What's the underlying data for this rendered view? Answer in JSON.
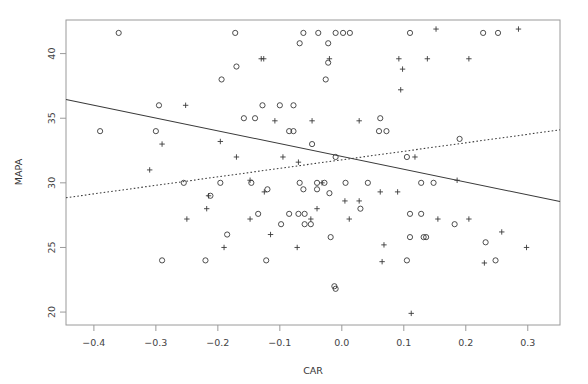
{
  "chart_data": {
    "type": "scatter",
    "title": "",
    "xlabel": "CAR",
    "ylabel": "MAPA",
    "xlim": [
      -0.445,
      0.352
    ],
    "ylim": [
      19.0,
      42.6
    ],
    "grid": false,
    "legend": "none",
    "xticks": [
      -0.4,
      -0.3,
      -0.2,
      -0.1,
      0.0,
      0.1,
      0.2,
      0.3
    ],
    "xtick_labels": [
      "-0.4",
      "-0.3",
      "-0.2",
      "-0.1",
      "0.0",
      "0.1",
      "0.2",
      "0.3"
    ],
    "yticks": [
      20,
      25,
      30,
      35,
      40
    ],
    "ytick_labels": [
      "20",
      "25",
      "30",
      "35",
      "40"
    ],
    "series": [
      {
        "name": "group-circle",
        "marker": "circle",
        "color": "#3a3a3a",
        "points": [
          [
            -0.36,
            41.6
          ],
          [
            -0.172,
            41.6
          ],
          [
            -0.062,
            41.6
          ],
          [
            -0.038,
            41.6
          ],
          [
            -0.01,
            41.6
          ],
          [
            0.002,
            41.6
          ],
          [
            0.013,
            41.6
          ],
          [
            0.11,
            41.6
          ],
          [
            0.228,
            41.6
          ],
          [
            0.252,
            41.6
          ],
          [
            -0.068,
            40.8
          ],
          [
            -0.022,
            40.8
          ],
          [
            -0.17,
            39.0
          ],
          [
            -0.022,
            39.3
          ],
          [
            -0.194,
            38.0
          ],
          [
            -0.026,
            38.0
          ],
          [
            -0.295,
            36.0
          ],
          [
            -0.128,
            36.0
          ],
          [
            -0.1,
            36.0
          ],
          [
            -0.078,
            36.0
          ],
          [
            -0.158,
            35.0
          ],
          [
            -0.14,
            35.0
          ],
          [
            0.062,
            35.0
          ],
          [
            -0.39,
            34.0
          ],
          [
            -0.3,
            34.0
          ],
          [
            -0.085,
            34.0
          ],
          [
            -0.078,
            34.0
          ],
          [
            0.06,
            34.0
          ],
          [
            0.072,
            34.0
          ],
          [
            -0.048,
            33.0
          ],
          [
            0.19,
            33.4
          ],
          [
            -0.01,
            32.0
          ],
          [
            0.105,
            32.0
          ],
          [
            -0.255,
            30.0
          ],
          [
            -0.196,
            30.0
          ],
          [
            -0.146,
            30.0
          ],
          [
            -0.068,
            30.0
          ],
          [
            -0.04,
            30.0
          ],
          [
            -0.028,
            30.0
          ],
          [
            0.006,
            30.0
          ],
          [
            0.042,
            30.0
          ],
          [
            0.128,
            30.0
          ],
          [
            0.148,
            30.0
          ],
          [
            -0.12,
            29.5
          ],
          [
            -0.062,
            29.5
          ],
          [
            -0.04,
            29.5
          ],
          [
            -0.212,
            29.0
          ],
          [
            -0.02,
            29.2
          ],
          [
            0.03,
            28.0
          ],
          [
            -0.135,
            27.6
          ],
          [
            -0.085,
            27.6
          ],
          [
            -0.07,
            27.6
          ],
          [
            -0.06,
            27.6
          ],
          [
            0.11,
            27.6
          ],
          [
            0.128,
            27.6
          ],
          [
            -0.098,
            26.8
          ],
          [
            -0.06,
            26.8
          ],
          [
            -0.05,
            26.8
          ],
          [
            0.182,
            26.8
          ],
          [
            -0.185,
            26.0
          ],
          [
            -0.018,
            25.8
          ],
          [
            0.11,
            25.8
          ],
          [
            0.132,
            25.8
          ],
          [
            0.136,
            25.8
          ],
          [
            0.232,
            25.4
          ],
          [
            -0.29,
            24.0
          ],
          [
            -0.22,
            24.0
          ],
          [
            -0.122,
            24.0
          ],
          [
            0.105,
            24.0
          ],
          [
            0.248,
            24.0
          ],
          [
            -0.012,
            22.0
          ],
          [
            -0.01,
            21.8
          ]
        ]
      },
      {
        "name": "group-plus",
        "marker": "plus",
        "color": "#3a3a3a",
        "points": [
          [
            0.152,
            41.9
          ],
          [
            0.285,
            41.9
          ],
          [
            -0.02,
            39.6
          ],
          [
            0.092,
            39.6
          ],
          [
            0.138,
            39.6
          ],
          [
            0.205,
            39.6
          ],
          [
            -0.13,
            39.6
          ],
          [
            -0.126,
            39.6
          ],
          [
            0.098,
            38.8
          ],
          [
            0.095,
            37.2
          ],
          [
            -0.252,
            36.0
          ],
          [
            -0.108,
            34.8
          ],
          [
            -0.048,
            34.8
          ],
          [
            0.028,
            34.8
          ],
          [
            -0.29,
            33.0
          ],
          [
            -0.196,
            33.2
          ],
          [
            -0.17,
            32.0
          ],
          [
            -0.095,
            32.0
          ],
          [
            0.118,
            32.0
          ],
          [
            -0.31,
            31.0
          ],
          [
            -0.07,
            31.6
          ],
          [
            -0.148,
            30.2
          ],
          [
            -0.032,
            30.0
          ],
          [
            0.186,
            30.2
          ],
          [
            -0.215,
            29.0
          ],
          [
            -0.125,
            29.3
          ],
          [
            0.062,
            29.3
          ],
          [
            0.09,
            29.3
          ],
          [
            0.005,
            28.6
          ],
          [
            0.028,
            28.6
          ],
          [
            -0.218,
            28.0
          ],
          [
            -0.04,
            28.0
          ],
          [
            -0.25,
            27.2
          ],
          [
            -0.148,
            27.2
          ],
          [
            -0.05,
            27.2
          ],
          [
            0.012,
            27.2
          ],
          [
            0.155,
            27.2
          ],
          [
            0.205,
            27.2
          ],
          [
            -0.115,
            26.0
          ],
          [
            0.258,
            26.2
          ],
          [
            -0.19,
            25.0
          ],
          [
            -0.072,
            25.0
          ],
          [
            0.068,
            25.2
          ],
          [
            0.298,
            25.0
          ],
          [
            0.065,
            23.9
          ],
          [
            0.23,
            23.8
          ],
          [
            0.112,
            19.9
          ]
        ]
      }
    ],
    "fit_lines": [
      {
        "name": "solid-fit",
        "style": "solid",
        "x_start": -0.445,
        "y_start": 36.45,
        "x_end": 0.352,
        "y_end": 28.55
      },
      {
        "name": "dotted-fit",
        "style": "dotted",
        "x_start": -0.445,
        "y_start": 28.85,
        "x_end": 0.352,
        "y_end": 34.1
      }
    ]
  }
}
